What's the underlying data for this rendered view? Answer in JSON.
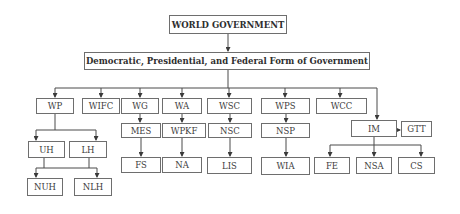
{
  "diagram": {
    "title": "WORLD GOVERNMENT",
    "form": "Democratic, Presidential, and Federal Form of Government",
    "nodes": {
      "wp": "WP",
      "wifc": "WIFC",
      "wg": "WG",
      "wa": "WA",
      "wsc": "WSC",
      "wps": "WPS",
      "wcc": "WCC",
      "im": "IM",
      "gtt": "GTT",
      "uh": "UH",
      "lh": "LH",
      "nuh": "NUH",
      "nlh": "NLH",
      "mes": "MES",
      "wpkf": "WPKF",
      "nsc": "NSC",
      "nsp": "NSP",
      "fs": "FS",
      "na": "NA",
      "lis": "LIS",
      "wia": "WIA",
      "fe": "FE",
      "nsa": "NSA",
      "cs": "CS"
    },
    "edges": [
      [
        "title",
        "form"
      ],
      [
        "form",
        "wp"
      ],
      [
        "form",
        "wifc"
      ],
      [
        "form",
        "wg"
      ],
      [
        "form",
        "wa"
      ],
      [
        "form",
        "wsc"
      ],
      [
        "form",
        "wps"
      ],
      [
        "form",
        "wcc"
      ],
      [
        "form",
        "im"
      ],
      [
        "wp",
        "uh"
      ],
      [
        "wp",
        "lh"
      ],
      [
        "uh",
        "nuh"
      ],
      [
        "uh",
        "nlh"
      ],
      [
        "lh",
        "nuh"
      ],
      [
        "lh",
        "nlh"
      ],
      [
        "wg",
        "mes"
      ],
      [
        "mes",
        "fs"
      ],
      [
        "wa",
        "wpkf"
      ],
      [
        "wpkf",
        "na"
      ],
      [
        "wsc",
        "nsc"
      ],
      [
        "nsc",
        "lis"
      ],
      [
        "wps",
        "nsp"
      ],
      [
        "nsp",
        "wia"
      ],
      [
        "im",
        "gtt"
      ],
      [
        "im",
        "fe"
      ],
      [
        "im",
        "nsa"
      ],
      [
        "im",
        "cs"
      ]
    ],
    "colors": {
      "line": "#4a4a4a",
      "border": "#6e6e6e",
      "text": "#3c3c3c",
      "background": "#ffffff"
    }
  }
}
